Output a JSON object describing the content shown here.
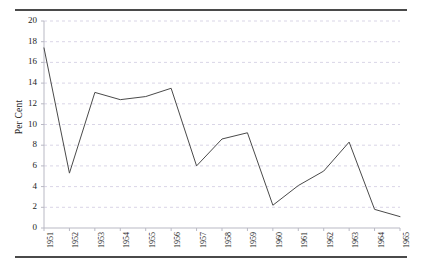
{
  "chart_data": {
    "type": "line",
    "title": "",
    "subtitle": "",
    "xlabel": "",
    "ylabel": "Per Cent",
    "categories": [
      "1951",
      "1952",
      "1953",
      "1954",
      "1955",
      "1956",
      "1957",
      "1958",
      "1959",
      "1960",
      "1961",
      "1962",
      "1963",
      "1964",
      "1965"
    ],
    "values": [
      17.4,
      5.3,
      13.1,
      12.4,
      12.7,
      13.5,
      6.0,
      8.6,
      9.2,
      2.2,
      4.1,
      5.5,
      8.3,
      1.8,
      1.1
    ],
    "series": [
      {
        "name": "Per Cent",
        "values": [
          17.4,
          5.3,
          13.1,
          12.4,
          12.7,
          13.5,
          6.0,
          8.6,
          9.2,
          2.2,
          4.1,
          5.5,
          8.3,
          1.8,
          1.1
        ]
      }
    ],
    "ylim": [
      0,
      20
    ],
    "ytick_labels": [
      "0",
      "2",
      "4",
      "6",
      "8",
      "10",
      "12",
      "14",
      "16",
      "18",
      "20"
    ],
    "ytick_values": [
      0,
      2,
      4,
      6,
      8,
      10,
      12,
      14,
      16,
      18,
      20
    ],
    "grid": "horizontal-dashed",
    "legend": "none",
    "line_color": "#4a4a4a",
    "grid_color": "#cfcadf",
    "axis_color": "#b9b9c4",
    "rule_color": "#4a4a4a",
    "annotations": []
  },
  "figure": {
    "top_rule": "horizontal-rule",
    "bottom_rule": "horizontal-rule"
  }
}
